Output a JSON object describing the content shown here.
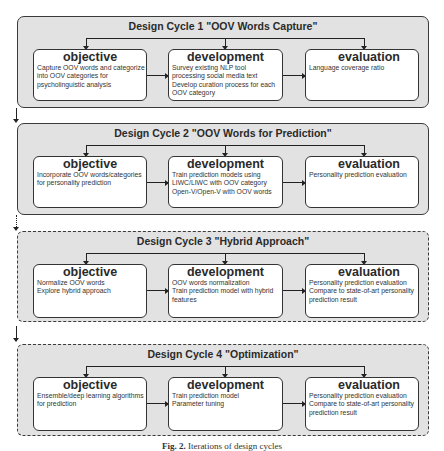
{
  "cycles": [
    {
      "title": "Design Cycle 1 \"OOV Words Capture\"",
      "border": "solid",
      "objective": {
        "label": "objective",
        "lines": [
          "Capture OOV words and categorize",
          "into OOV categories for",
          "psycholinguistic analysis"
        ]
      },
      "development": {
        "label": "development",
        "lines": [
          "Survey existing NLP tool",
          "processing social media text",
          "Develop curation process for each",
          "OOV category"
        ]
      },
      "evaluation": {
        "label": "evaluation",
        "lines": [
          "Language coverage ratio"
        ]
      }
    },
    {
      "title": "Design Cycle 2 \"OOV Words for Prediction\"",
      "border": "solid",
      "objective": {
        "label": "objective",
        "lines": [
          "Incorporate OOV words/categories",
          "for personality prediction"
        ]
      },
      "development": {
        "label": "development",
        "lines": [
          "Train prediction models using",
          "LIWC/LIWC with OOV category",
          "Open-V/Open-V with OOV words"
        ]
      },
      "evaluation": {
        "label": "evaluation",
        "lines": [
          "Personality prediction evaluation"
        ]
      }
    },
    {
      "title": "Design Cycle 3 \"Hybrid Approach\"",
      "border": "dashed",
      "objective": {
        "label": "objective",
        "lines": [
          "Normalize OOV words",
          "Explore hybrid approach"
        ]
      },
      "development": {
        "label": "development",
        "lines": [
          "OOV words normalization",
          "Train prediction model with hybrid",
          "features"
        ]
      },
      "evaluation": {
        "label": "evaluation",
        "lines": [
          "Personality prediction evaluation",
          "Compare to state-of-art personality",
          "prediction result"
        ]
      }
    },
    {
      "title": "Design Cycle 4 \"Optimization\"",
      "border": "dashed",
      "objective": {
        "label": "objective",
        "lines": [
          "Ensemble/deep learning algorithms",
          "for prediction"
        ]
      },
      "development": {
        "label": "development",
        "lines": [
          "Train prediction model",
          "Parameter tuning"
        ]
      },
      "evaluation": {
        "label": "evaluation",
        "lines": [
          "Personality prediction evaluation",
          "Compare to state-of-art personality",
          "prediction result"
        ]
      }
    }
  ],
  "caption": {
    "label": "Fig. 2.",
    "text": "Iterations of design cycles"
  },
  "colors": {
    "cycle_bg": "#e2e2e2",
    "box_bg": "#ffffff",
    "stroke": "#222222"
  }
}
